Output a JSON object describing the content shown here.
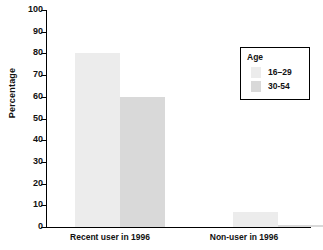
{
  "chart_data": {
    "type": "bar",
    "title": "",
    "xlabel": "",
    "ylabel": "Percentage",
    "ylim": [
      0,
      100
    ],
    "yticks": [
      0,
      10,
      20,
      30,
      40,
      50,
      60,
      70,
      80,
      90,
      100
    ],
    "ytick_labels": [
      "0",
      "10",
      "20",
      "30",
      "40",
      "50",
      "60",
      "70",
      "80",
      "90",
      "100"
    ],
    "grid": false,
    "legend_position": "top-right",
    "legend_title": "Age",
    "categories": [
      "Recent user in 1996",
      "Non-user in 1996"
    ],
    "series": [
      {
        "name": "16-29",
        "values": [
          80,
          7
        ],
        "color": "#ececec"
      },
      {
        "name": "30-54",
        "values": [
          60,
          1
        ],
        "color": "#d9d9d9"
      }
    ]
  },
  "axis": {
    "y_label": "Percentage",
    "tick_0": "0",
    "tick_10": "10",
    "tick_20": "20",
    "tick_30": "30",
    "tick_40": "40",
    "tick_50": "50",
    "tick_60": "60",
    "tick_70": "70",
    "tick_80": "80",
    "tick_90": "90",
    "tick_100": "100"
  },
  "groups": {
    "g0_label": "Recent user in 1996",
    "g1_label": "Non-user in 1996"
  },
  "legend": {
    "title": "Age",
    "entry0_label": "16–29",
    "entry1_label": "30-54"
  }
}
